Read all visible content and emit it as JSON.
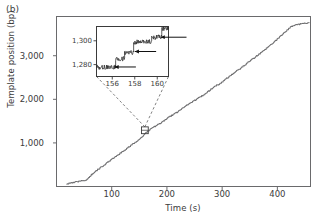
{
  "panel": {
    "label": "(b)"
  },
  "chart_data": {
    "type": "line",
    "title": "",
    "xlabel": "Time (s)",
    "ylabel": "Template position (bp)",
    "xlim": [
      0,
      460
    ],
    "ylim": [
      0,
      3900
    ],
    "xticks": [
      100,
      200,
      300,
      400
    ],
    "xticklabels": [
      "100",
      "200",
      "300",
      "400"
    ],
    "yticks": [
      1000,
      2000,
      3000
    ],
    "yticklabels": [
      "1,000",
      "2,000",
      "3,000"
    ],
    "grid": false,
    "legend": null,
    "series": [
      {
        "name": "Template position trace",
        "x": [
          18,
          24,
          30,
          36,
          42,
          48,
          54,
          58,
          62,
          66,
          70,
          76,
          82,
          88,
          94,
          100,
          106,
          112,
          118,
          124,
          130,
          136,
          142,
          148,
          154,
          158,
          162,
          168,
          174,
          180,
          186,
          192,
          198,
          204,
          210,
          214,
          218,
          224,
          230,
          236,
          242,
          248,
          254,
          260,
          266,
          272,
          278,
          284,
          290,
          296,
          302,
          308,
          314,
          320,
          326,
          332,
          338,
          344,
          350,
          356,
          362,
          368,
          374,
          380,
          386,
          392,
          398,
          404,
          410,
          416,
          422,
          428,
          434,
          440,
          446,
          452,
          458
        ],
        "y": [
          60,
          75,
          95,
          110,
          120,
          135,
          150,
          205,
          255,
          300,
          345,
          400,
          455,
          510,
          570,
          625,
          680,
          735,
          790,
          845,
          900,
          955,
          1010,
          1065,
          1120,
          1175,
          1240,
          1300,
          1350,
          1395,
          1440,
          1490,
          1545,
          1600,
          1640,
          1680,
          1700,
          1760,
          1815,
          1870,
          1905,
          1960,
          2010,
          2060,
          2100,
          2155,
          2215,
          2270,
          2325,
          2360,
          2420,
          2480,
          2535,
          2590,
          2650,
          2700,
          2760,
          2820,
          2880,
          2935,
          2995,
          3050,
          3110,
          3170,
          3235,
          3295,
          3360,
          3430,
          3500,
          3570,
          3640,
          3690,
          3715,
          3725,
          3735,
          3745,
          3765
        ]
      }
    ],
    "annotations": [
      {
        "name": "zoom-region-marker",
        "x": 160,
        "y": 1290,
        "shape": "square"
      }
    ],
    "inset": {
      "type": "line",
      "xlabel": "",
      "ylabel": "",
      "xlim": [
        154.6,
        161.0
      ],
      "ylim": [
        1270,
        1312
      ],
      "xticks": [
        156,
        158,
        160
      ],
      "xticklabels": [
        "156",
        "158",
        "160"
      ],
      "yticks": [
        1280,
        1300
      ],
      "yticklabels": [
        "1,280",
        "1,300"
      ],
      "grid": false,
      "series": [
        {
          "name": "Stepping trace",
          "steps": [
            {
              "x_start": 154.6,
              "x_end": 156.3,
              "level": 1278
            },
            {
              "x_start": 156.3,
              "x_end": 157.1,
              "level": 1285
            },
            {
              "x_start": 157.1,
              "x_end": 157.9,
              "level": 1290
            },
            {
              "x_start": 157.9,
              "x_end": 159.5,
              "level": 1299
            },
            {
              "x_start": 159.5,
              "x_end": 160.4,
              "level": 1303
            },
            {
              "x_start": 160.4,
              "x_end": 161.0,
              "level": 1310
            }
          ]
        }
      ],
      "arrows": [
        {
          "name": "step-arrow-1",
          "tip_x": 156.2,
          "tip_y": 1278,
          "tail_x": 158.1,
          "tail_y": 1278
        },
        {
          "name": "step-arrow-2",
          "tip_x": 158.0,
          "tip_y": 1291,
          "tail_x": 159.9,
          "tail_y": 1291
        },
        {
          "name": "step-arrow-3",
          "tip_x": 160.3,
          "tip_y": 1303,
          "tail_x": 162.6,
          "tail_y": 1303
        }
      ]
    }
  }
}
